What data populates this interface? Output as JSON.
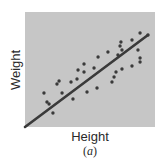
{
  "chart_data": {
    "type": "scatter",
    "title": "",
    "xlabel": "Height",
    "ylabel": "Weight",
    "caption": "(a)",
    "caption_letter": "a",
    "xlim": [
      0,
      100
    ],
    "ylim": [
      0,
      100
    ],
    "grid": false,
    "ticks": false,
    "legend": null,
    "colors": {
      "background": "#c6c6c6",
      "points": "#3a3a3a",
      "line": "#3a3a3a"
    },
    "series": [
      {
        "name": "observations",
        "kind": "points",
        "points": [
          [
            14.6,
            29.6
          ],
          [
            16.9,
            21.7
          ],
          [
            18.5,
            20.0
          ],
          [
            21.5,
            12.2
          ],
          [
            24.6,
            37.4
          ],
          [
            26.2,
            40.0
          ],
          [
            28.5,
            29.6
          ],
          [
            35.4,
            39.1
          ],
          [
            36.9,
            24.3
          ],
          [
            40.0,
            41.7
          ],
          [
            40.8,
            49.6
          ],
          [
            45.4,
            54.8
          ],
          [
            45.4,
            47.8
          ],
          [
            47.7,
            30.4
          ],
          [
            53.1,
            51.3
          ],
          [
            55.4,
            33.9
          ],
          [
            56.2,
            60.9
          ],
          [
            63.8,
            65.2
          ],
          [
            66.9,
            39.1
          ],
          [
            68.5,
            43.5
          ],
          [
            70.0,
            47.8
          ],
          [
            71.5,
            62.6
          ],
          [
            73.1,
            70.4
          ],
          [
            73.8,
            73.9
          ],
          [
            74.6,
            67.0
          ],
          [
            74.6,
            50.4
          ],
          [
            82.3,
            75.7
          ],
          [
            82.3,
            53.0
          ],
          [
            86.9,
            67.0
          ],
          [
            88.5,
            60.0
          ],
          [
            88.5,
            56.5
          ],
          [
            88.5,
            81.7
          ],
          [
            94.6,
            80.0
          ]
        ]
      },
      {
        "name": "trend line",
        "kind": "line",
        "points": [
          [
            0,
            0
          ],
          [
            94.6,
            80.0
          ]
        ]
      }
    ]
  }
}
